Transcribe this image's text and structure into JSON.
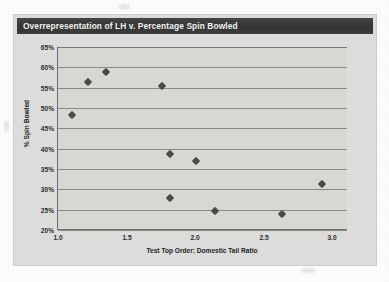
{
  "figure": {
    "title": "Overrepresentation of LH v. Percentage Spin Bowled",
    "title_bar_color": "#3b3b3b",
    "plot_background_color": "#d7d7d4",
    "marker_color": "#4a4a4a",
    "gridline_color": "#8b8b89"
  },
  "chart_data": {
    "type": "scatter",
    "title": "Overrepresentation of LH v. Percentage Spin Bowled",
    "xlabel": "Test Top Order: Domestic Tail Ratio",
    "ylabel": "% Spin Bowled",
    "xlim": [
      0.99,
      3.11
    ],
    "ylim": [
      20,
      65
    ],
    "grid": true,
    "legend": null,
    "xticks": [
      1.0,
      1.5,
      2.0,
      2.5,
      3.0
    ],
    "xtick_labels": [
      "1.0",
      "1.5",
      "2.0",
      "2.5",
      "3.0"
    ],
    "yticks": [
      20,
      25,
      30,
      35,
      40,
      45,
      50,
      55,
      60,
      65
    ],
    "ytick_labels": [
      "20%",
      "25%",
      "30%",
      "35%",
      "40%",
      "45%",
      "50%",
      "55%",
      "60%",
      "65%"
    ],
    "marker": "diamond",
    "points": [
      {
        "x": 1.09,
        "y": 48.3
      },
      {
        "x": 1.21,
        "y": 56.3
      },
      {
        "x": 1.34,
        "y": 58.8
      },
      {
        "x": 1.75,
        "y": 55.3
      },
      {
        "x": 1.81,
        "y": 38.8
      },
      {
        "x": 1.81,
        "y": 27.8
      },
      {
        "x": 2.0,
        "y": 36.9
      },
      {
        "x": 2.14,
        "y": 24.7
      },
      {
        "x": 2.63,
        "y": 24.0
      },
      {
        "x": 2.92,
        "y": 31.3
      }
    ]
  }
}
